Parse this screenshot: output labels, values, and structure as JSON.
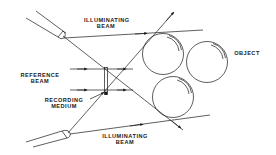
{
  "diagram": {
    "type": "holography-recording-setup",
    "line_color": "#1a1a1a",
    "background": "#ffffff",
    "labels": {
      "illuminating_beam_top": {
        "line1": "ILLUMINATING",
        "line2": "BEAM"
      },
      "illuminating_beam_bottom": {
        "line1": "ILLUMINATING",
        "line2": "BEAM"
      },
      "reference_beam": {
        "line1": "REFERENCE",
        "line2": "BEAM"
      },
      "recording_medium": {
        "line1": "RECORDING",
        "line2": "MEDIUM"
      },
      "object": {
        "line1": "OBJECT"
      }
    },
    "components": [
      {
        "name": "upper-lens",
        "kind": "lens"
      },
      {
        "name": "lower-lens",
        "kind": "lens"
      },
      {
        "name": "recording-medium",
        "kind": "plate"
      },
      {
        "name": "object-sphere-1",
        "kind": "sphere"
      },
      {
        "name": "object-sphere-2",
        "kind": "sphere"
      },
      {
        "name": "object-sphere-3",
        "kind": "sphere"
      }
    ],
    "beams": [
      {
        "name": "upper-illuminating-beam",
        "direction": "right"
      },
      {
        "name": "lower-illuminating-beam",
        "direction": "right"
      },
      {
        "name": "reference-beam-upper-ray",
        "direction": "right"
      },
      {
        "name": "reference-beam-lower-ray",
        "direction": "right"
      },
      {
        "name": "diagonal-ray-down",
        "direction": "down-right"
      },
      {
        "name": "diagonal-ray-up",
        "direction": "up-right"
      }
    ]
  }
}
